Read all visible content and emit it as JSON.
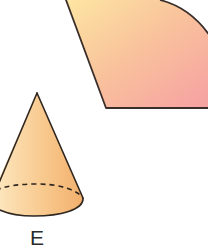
{
  "figure": {
    "sector": {
      "fill_gradient": [
        "#fde3a0",
        "#f9b79a",
        "#f6a1a0"
      ],
      "stroke": "#3a2e2a"
    },
    "cone": {
      "label": "E",
      "fill_gradient": [
        "#fde1b2",
        "#f7c589",
        "#f2b270"
      ],
      "stroke": "#2f2620",
      "base_hidden_edge": "dashed"
    }
  }
}
